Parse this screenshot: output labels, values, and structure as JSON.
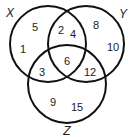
{
  "diagram": {
    "type": "venn",
    "sets": [
      {
        "name": "X",
        "cx": 48,
        "cy": 44,
        "r": 38,
        "label_x": 10,
        "label_y": 13
      },
      {
        "name": "Y",
        "cx": 86,
        "cy": 44,
        "r": 38,
        "label_x": 123,
        "label_y": 14
      },
      {
        "name": "Z",
        "cx": 67,
        "cy": 84,
        "r": 39,
        "label_x": 67,
        "label_y": 131
      }
    ],
    "regions": [
      {
        "region": "X only",
        "values": [
          "5",
          "1"
        ]
      },
      {
        "region": "X and Y only",
        "values": [
          "2",
          "4"
        ]
      },
      {
        "region": "Y only",
        "values": [
          "8",
          "10"
        ]
      },
      {
        "region": "X, Y and Z",
        "values": [
          "6"
        ]
      },
      {
        "region": "X and Z only",
        "values": [
          "3"
        ]
      },
      {
        "region": "Y and Z only",
        "values": [
          "12"
        ]
      },
      {
        "region": "Z only",
        "values": [
          "9",
          "15"
        ]
      }
    ],
    "stroke_color": "#111111"
  },
  "labels": {
    "X": "X",
    "Y": "Y",
    "Z": "Z",
    "n5": "5",
    "n1": "1",
    "n2": "2",
    "n4": "4",
    "n8": "8",
    "n10": "10",
    "n6": "6",
    "n3": "3",
    "n12": "12",
    "n9": "9",
    "n15": "15"
  }
}
